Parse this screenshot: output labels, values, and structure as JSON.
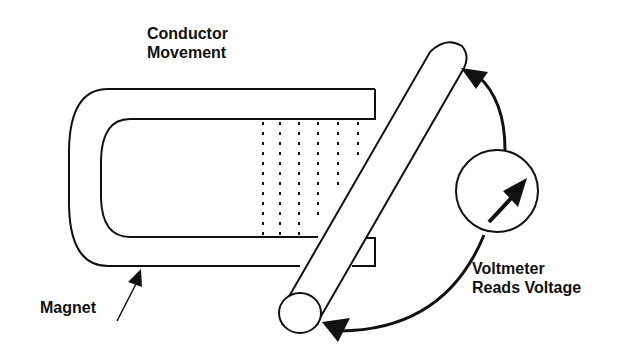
{
  "diagram": {
    "labels": {
      "conductor_movement_line1": "Conductor",
      "conductor_movement_line2": "Movement",
      "magnet": "Magnet",
      "voltmeter_line1": "Voltmeter",
      "voltmeter_line2": "Reads Voltage"
    },
    "components": [
      {
        "name": "magnet",
        "shape": "horseshoe"
      },
      {
        "name": "magnetic-field-lines",
        "count": 6,
        "style": "dotted"
      },
      {
        "name": "conductor",
        "shape": "cylinder"
      },
      {
        "name": "voltmeter",
        "shape": "circle-with-arrow"
      },
      {
        "name": "circuit-wires",
        "count": 2,
        "style": "curved-arrows"
      }
    ],
    "colors": {
      "stroke": "#111111",
      "background": "#ffffff"
    }
  }
}
